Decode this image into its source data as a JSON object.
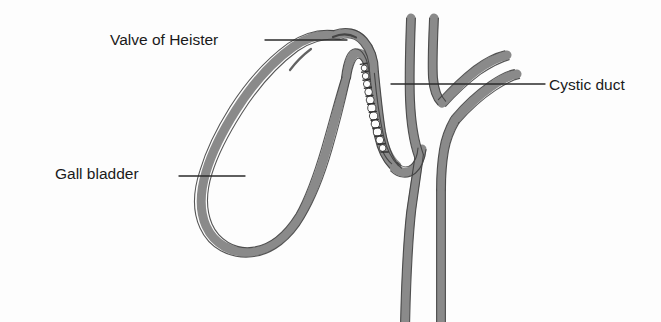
{
  "figure": {
    "type": "anatomical-line-diagram",
    "background_color": "#fdfdfd",
    "wall_fill_color": "#8a8a8a",
    "wall_outline_color": "#3a3a3a",
    "lumen_color": "#fdfdfd",
    "text_color": "#1a1a1a",
    "leader_line_color": "#2b2b2b"
  },
  "labels": {
    "valve_of_heister": "Valve of Heister",
    "gall_bladder": "Gall bladder",
    "cystic_duct": "Cystic duct"
  },
  "structures": [
    {
      "name": "gall-bladder",
      "label": "Gall bladder",
      "description": "Pear-shaped sac drawn as a long U-loop descending to the lower left, its fundus rounded at the bottom and its body ascending to the neck at the top."
    },
    {
      "name": "valve-of-heister",
      "label": "Valve of Heister",
      "description": "Spiral mucosal folds shown as a descending chain of white scalloped bumps lining the inner wall of the cystic duct below the gall bladder neck."
    },
    {
      "name": "cystic-duct",
      "label": "Cystic duct",
      "description": "Narrow duct running from the gall bladder neck down and to the right to join the common hepatic duct."
    },
    {
      "name": "hepatic-ducts",
      "label": "",
      "description": "Branching hepatic ducts entering from the top and upper right of the figure."
    },
    {
      "name": "common-bile-duct",
      "label": "",
      "description": "Common bile duct continuing downward off the bottom edge of the figure."
    }
  ],
  "leader_lines": [
    {
      "name": "leader-valve-of-heister",
      "label": "Valve of Heister",
      "from": [
        265,
        40
      ],
      "to": [
        347,
        40
      ]
    },
    {
      "name": "leader-gall-bladder",
      "label": "Gall bladder",
      "from": [
        179,
        176
      ],
      "to": [
        245,
        176
      ]
    },
    {
      "name": "leader-cystic-duct",
      "label": "Cystic duct",
      "from": [
        391,
        84
      ],
      "to": [
        545,
        84
      ]
    }
  ],
  "valve_folds": {
    "count": 11,
    "description": "White semicircular spiral folds along the cystic duct lumen"
  }
}
